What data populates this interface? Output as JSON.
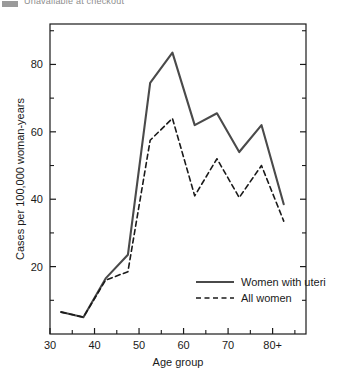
{
  "header": {
    "partial_caption": "Unavailable at checkout"
  },
  "chart_data": {
    "type": "line",
    "title": "",
    "xlabel": "Age group",
    "ylabel": "Cases per 100,000 woman-years",
    "xlim": [
      30,
      87.5
    ],
    "ylim": [
      0,
      92
    ],
    "xticks": [
      30,
      40,
      50,
      60,
      70,
      80
    ],
    "xtick_labels": [
      "30",
      "40",
      "50",
      "60",
      "70",
      "80+"
    ],
    "xminor_ticks": [
      35,
      45,
      55,
      65,
      75,
      85
    ],
    "yticks": [
      20,
      40,
      60,
      80
    ],
    "ytick_labels": [
      "20",
      "40",
      "60",
      "80"
    ],
    "yminor_ticks": [
      10,
      30,
      50,
      70,
      90
    ],
    "grid": false,
    "legend_position": "lower right",
    "x": [
      32.5,
      37.5,
      42.5,
      47.5,
      52.5,
      57.5,
      62.5,
      67.5,
      72.5,
      77.5,
      82.5
    ],
    "series": [
      {
        "name": "Women with uteri",
        "style": "solid",
        "color": "#4a4a4a",
        "values": [
          6.5,
          5.0,
          16.5,
          23.5,
          74.5,
          83.5,
          62.0,
          65.5,
          54.0,
          62.0,
          38.5
        ]
      },
      {
        "name": "All women",
        "style": "dashed",
        "color": "#1a1a1a",
        "values": [
          6.5,
          5.0,
          16.0,
          18.5,
          57.5,
          64.0,
          41.0,
          52.0,
          40.5,
          50.0,
          33.5
        ]
      }
    ]
  }
}
